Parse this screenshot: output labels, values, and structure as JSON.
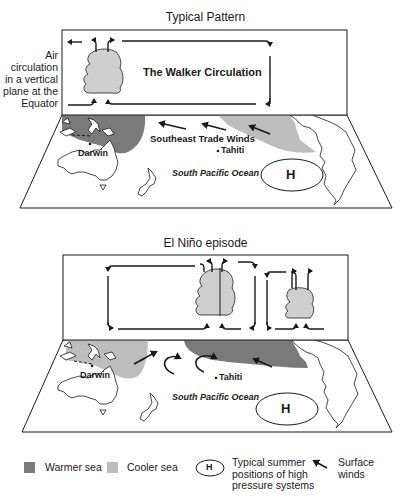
{
  "colors": {
    "warmer_sea": "#7a7a7a",
    "cooler_sea": "#bdbdbd",
    "cloud": "#cfcfcf",
    "line": "#1a1a1a",
    "background": "#ffffff"
  },
  "top_panel": {
    "title": "Typical Pattern",
    "side_label_lines": [
      "Air",
      "circulation",
      "in a vertical",
      "plane at the",
      "Equator"
    ],
    "circulation_label": "The Walker Circulation",
    "map_labels": {
      "darwin": "Darwin",
      "winds": "Southeast Trade Winds",
      "tahiti": "Tahiti",
      "ocean": "South Pacific Ocean",
      "high": "H"
    }
  },
  "bottom_panel": {
    "title": "El Niño episode",
    "map_labels": {
      "darwin": "Darwin",
      "tahiti": "Tahiti",
      "ocean": "South Pacific Ocean",
      "high": "H"
    }
  },
  "legend": {
    "items": [
      {
        "icon": "warmer-sea-swatch",
        "label": "Warmer sea"
      },
      {
        "icon": "cooler-sea-swatch",
        "label": "Cooler sea"
      },
      {
        "icon": "high-pressure-ellipse",
        "symbol": "H",
        "label_lines": [
          "Typical summer",
          "positions of high",
          "pressure systems"
        ]
      },
      {
        "icon": "surface-wind-arrow",
        "label_lines": [
          "Surface",
          "winds"
        ]
      }
    ]
  }
}
